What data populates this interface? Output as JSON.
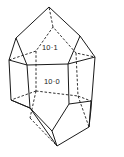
{
  "diagram": {
    "type": "crystal-habit",
    "face_labels": [
      {
        "text": "10·1",
        "face": "pyramid-face"
      },
      {
        "text": "10·0",
        "face": "prism-face"
      }
    ]
  }
}
